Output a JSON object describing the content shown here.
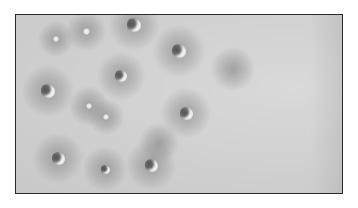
{
  "image": {
    "description": "Grayscale micrograph-like image of scattered particles with dark halos inside a thin black frame",
    "frame": {
      "x": 15,
      "y": 14,
      "width": 328,
      "height": 180,
      "border_color": "#2a2a2a"
    },
    "background_color": "#cfcfcf",
    "particles": [
      {
        "x": 133,
        "y": 24,
        "size": 14,
        "halo": 50
      },
      {
        "x": 85,
        "y": 30,
        "size": 7,
        "halo": 40
      },
      {
        "x": 55,
        "y": 38,
        "size": 6,
        "halo": 36
      },
      {
        "x": 178,
        "y": 50,
        "size": 14,
        "halo": 52
      },
      {
        "x": 120,
        "y": 75,
        "size": 12,
        "halo": 48
      },
      {
        "x": 47,
        "y": 90,
        "size": 14,
        "halo": 52
      },
      {
        "x": 88,
        "y": 105,
        "size": 6,
        "halo": 40
      },
      {
        "x": 105,
        "y": 116,
        "size": 6,
        "halo": 36
      },
      {
        "x": 185,
        "y": 112,
        "size": 13,
        "halo": 50
      },
      {
        "x": 57,
        "y": 157,
        "size": 13,
        "halo": 50
      },
      {
        "x": 104,
        "y": 168,
        "size": 9,
        "halo": 44
      },
      {
        "x": 150,
        "y": 164,
        "size": 13,
        "halo": 50
      }
    ],
    "empty_halos": [
      {
        "x": 232,
        "y": 68,
        "halo": 44
      },
      {
        "x": 158,
        "y": 142,
        "halo": 40
      }
    ]
  }
}
